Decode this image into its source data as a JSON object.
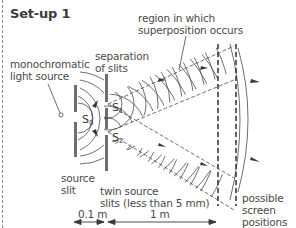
{
  "title": "Set-up 1",
  "labels": {
    "light_source": [
      "monochromatic",
      "light source"
    ],
    "separation": [
      "separation",
      "of slits"
    ],
    "region": [
      "region in which",
      "superposition occurs"
    ],
    "source_slit": [
      "source",
      "slit"
    ],
    "twin_slits": [
      "twin source",
      "slits (less than 5 mm)"
    ],
    "screens": [
      "possible",
      "screen",
      "positions"
    ],
    "s0": "S",
    "s0_sub": "0",
    "s1": "S",
    "s1_sub": "1",
    "s2": "S",
    "s2_sub": "2"
  },
  "dimensions": {
    "d1": "0.1 m",
    "d2": "1 m"
  },
  "colors": {
    "ink": "#3a3a3a",
    "barrier": "#6e6e6e",
    "border": "#8a8a8a"
  }
}
